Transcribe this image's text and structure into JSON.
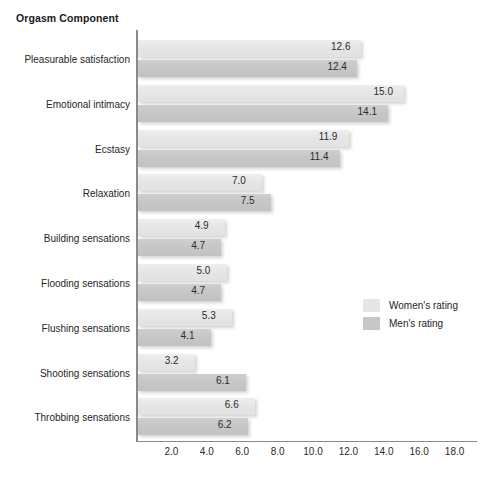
{
  "chart_data": {
    "type": "bar",
    "orientation": "horizontal",
    "title": "Orgasm Component",
    "xlabel": "",
    "ylabel": "",
    "xlim": [
      0,
      18.8
    ],
    "xticks": [
      "2.0",
      "4.0",
      "6.0",
      "8.0",
      "10.0",
      "12.0",
      "14.0",
      "16.0",
      "18.0"
    ],
    "xtick_values": [
      2.0,
      4.0,
      6.0,
      8.0,
      10.0,
      12.0,
      14.0,
      16.0,
      18.0
    ],
    "grid": false,
    "legend_position": "right-middle",
    "categories": [
      "Pleasurable satisfaction",
      "Emotional intimacy",
      "Ecstasy",
      "Relaxation",
      "Building sensations",
      "Flooding sensations",
      "Flushing sensations",
      "Shooting sensations",
      "Throbbing sensations"
    ],
    "series": [
      {
        "name": "Women's rating",
        "color": "#e6e6e6",
        "values": [
          12.6,
          15.0,
          11.9,
          7.0,
          4.9,
          5.0,
          5.3,
          3.2,
          6.6
        ],
        "labels": [
          "12.6",
          "15.0",
          "11.9",
          "7.0",
          "4.9",
          "5.0",
          "5.3",
          "3.2",
          "6.6"
        ]
      },
      {
        "name": "Men's rating",
        "color": "#c7c7c7",
        "values": [
          12.4,
          14.1,
          11.4,
          7.5,
          4.7,
          4.7,
          4.1,
          6.1,
          6.2
        ],
        "labels": [
          "12.4",
          "14.1",
          "11.4",
          "7.5",
          "4.7",
          "4.7",
          "4.1",
          "6.1",
          "6.2"
        ]
      }
    ]
  },
  "legend": {
    "items": [
      {
        "label": "Women's rating"
      },
      {
        "label": "Men's rating"
      }
    ]
  }
}
